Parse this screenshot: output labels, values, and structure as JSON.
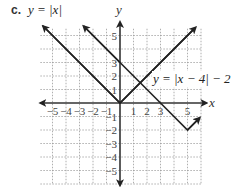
{
  "part": "c.",
  "chart_data": {
    "type": "line",
    "title": "",
    "xlabel": "x",
    "ylabel": "y",
    "xlim": [
      -5.9,
      6.4
    ],
    "ylim": [
      -6.1,
      6.0
    ],
    "grid": true,
    "x_tick_labels": [
      "−5",
      "−4",
      "−3",
      "−2",
      "−1",
      "1",
      "2",
      "3",
      "5"
    ],
    "y_tick_labels": [
      "5",
      "3",
      "2",
      "1",
      "−1",
      "−2",
      "−3",
      "−4",
      "−5"
    ],
    "series": [
      {
        "name": "y = |x|",
        "label": "y = |x|",
        "points": [
          [
            -5.7,
            5.7
          ],
          [
            0,
            0
          ],
          [
            5.6,
            5.6
          ]
        ],
        "arrows": "both"
      },
      {
        "name": "y = |x − 4| − 2",
        "label": "y = |x − 4| − 2",
        "points": [
          [
            -2.7,
            5.7
          ],
          [
            0,
            3
          ],
          [
            3,
            0
          ],
          [
            5,
            -2
          ],
          [
            5.9,
            -1.1
          ]
        ],
        "arrows": "both"
      }
    ],
    "annotations": [
      {
        "text": "y = |x|",
        "position": "top-left"
      },
      {
        "text": "y = |x − 4| − 2",
        "position": "right, near (2.5, 2)"
      }
    ]
  },
  "labels": {
    "eq1": "y = |x|",
    "eq2": "y = |x − 4| − 2",
    "x_axis": "x",
    "y_axis": "y"
  }
}
